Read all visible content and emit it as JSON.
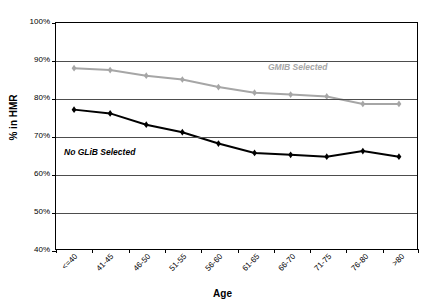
{
  "chart_data": {
    "type": "line",
    "title": "",
    "xlabel": "Age",
    "ylabel": "% in HMR",
    "categories": [
      "<=40",
      "41-45",
      "46-50",
      "51-55",
      "56-60",
      "61-65",
      "66-70",
      "71-75",
      "76-80",
      ">80"
    ],
    "ylim": [
      40,
      100
    ],
    "ytick_labels": [
      "100%",
      "90%",
      "80%",
      "70%",
      "60%",
      "50%",
      "40%"
    ],
    "ytick_values": [
      100,
      90,
      80,
      70,
      60,
      50,
      40
    ],
    "grid": true,
    "legend_position": "inline-annotations",
    "series": [
      {
        "name": "GMIB Selected",
        "color": "#a6a6a6",
        "marker": "diamond",
        "values": [
          88.0,
          87.5,
          86.0,
          85.0,
          83.0,
          81.5,
          81.0,
          80.5,
          78.5,
          78.5
        ]
      },
      {
        "name": "No GLiB Selected",
        "color": "#000000",
        "marker": "diamond",
        "values": [
          77.0,
          76.0,
          73.0,
          71.0,
          68.0,
          65.5,
          65.0,
          64.5,
          66.0,
          64.5
        ]
      }
    ],
    "annotations": [
      {
        "text": "GMIB Selected",
        "color": "#a6a6a6"
      },
      {
        "text": "No GLiB Selected",
        "color": "#000000"
      }
    ]
  }
}
